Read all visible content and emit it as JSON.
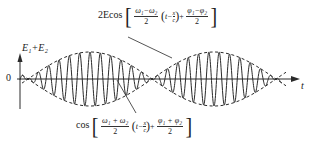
{
  "diagram": {
    "type": "beat-wave",
    "y_axis_label": "E₁+E₂",
    "origin_label": "0",
    "x_axis_label": "t",
    "envelope_label": {
      "prefix": "2Ecos",
      "frac1_num": "ω₁−ω₂",
      "frac1_den": "2",
      "paren_text": "t−",
      "x_over_c_num": "x",
      "x_over_c_den": "c",
      "plus": "+",
      "frac2_num": "φ₁−φ₂",
      "frac2_den": "2"
    },
    "carrier_label": {
      "prefix": "cos",
      "frac1_num": "ω₁ + ω₂",
      "frac1_den": "2",
      "paren_text": "t−",
      "x_over_c_num": "x",
      "x_over_c_den": "c",
      "plus": "+",
      "frac2_num": "φ₁ + φ₂",
      "frac2_den": "2"
    },
    "colors": {
      "stroke": "#2a2a2a",
      "background": "#ffffff"
    },
    "geometry": {
      "axis_y": 79,
      "axis_x": 20,
      "node_x": [
        28,
        152,
        274
      ],
      "max_amplitude": 27,
      "carrier_cycles_per_beat": 12
    }
  }
}
